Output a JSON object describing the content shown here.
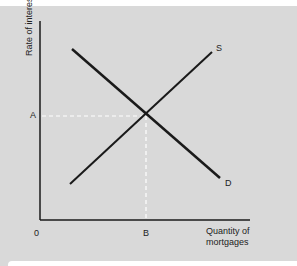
{
  "diagram": {
    "y_axis_label": "Rate of interest",
    "x_axis_label_line1": "Quantity of",
    "x_axis_label_line2": "mortgages",
    "origin_label": "0",
    "equilibrium_price_label": "A",
    "equilibrium_quantity_label": "B",
    "supply_label": "S",
    "demand_label": "D"
  },
  "colors": {
    "background": "#d9d9d9",
    "line": "#1a1a1a",
    "guide": "#ffffff"
  }
}
